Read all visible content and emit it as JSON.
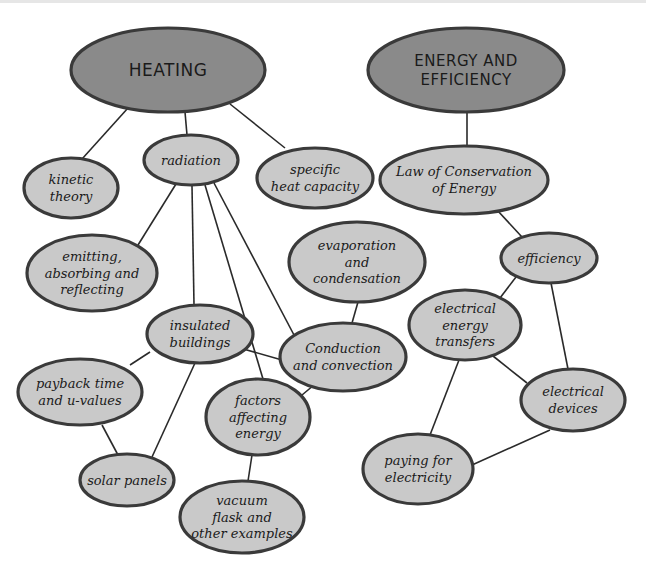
{
  "colors": {
    "root_fill": "#8a8a8a",
    "node_fill": "#c9c9c9",
    "outline": "#3a3a3a",
    "edge": "#2a2a2a",
    "background": "#ffffff"
  },
  "nodes": [
    {
      "id": "heating",
      "kind": "root",
      "lines": [
        "HEATING"
      ]
    },
    {
      "id": "energy",
      "kind": "root",
      "lines": [
        "ENERGY AND",
        "EFFICIENCY"
      ]
    },
    {
      "id": "kinetic",
      "kind": "node",
      "lines": [
        "kinetic",
        "theory"
      ]
    },
    {
      "id": "radiation",
      "kind": "node",
      "lines": [
        "radiation"
      ]
    },
    {
      "id": "specific",
      "kind": "node",
      "lines": [
        "specific",
        "heat capacity"
      ]
    },
    {
      "id": "emitting",
      "kind": "node",
      "lines": [
        "emitting,",
        "absorbing and",
        "reflecting"
      ]
    },
    {
      "id": "evaporation",
      "kind": "node",
      "lines": [
        "evaporation",
        "and",
        "condensation"
      ]
    },
    {
      "id": "insulated",
      "kind": "node",
      "lines": [
        "insulated",
        "buildings"
      ]
    },
    {
      "id": "conduction",
      "kind": "node",
      "lines": [
        "Conduction",
        "and convection"
      ]
    },
    {
      "id": "payback",
      "kind": "node",
      "lines": [
        "payback time",
        "and u-values"
      ]
    },
    {
      "id": "factors",
      "kind": "node",
      "lines": [
        "factors",
        "affecting",
        "energy"
      ]
    },
    {
      "id": "solar",
      "kind": "node",
      "lines": [
        "solar panels"
      ]
    },
    {
      "id": "vacuum",
      "kind": "node",
      "lines": [
        "vacuum",
        "flask and",
        "other examples"
      ]
    },
    {
      "id": "law",
      "kind": "node",
      "lines": [
        "Law of Conservation",
        "of Energy"
      ]
    },
    {
      "id": "efficiency",
      "kind": "node",
      "lines": [
        "efficiency"
      ]
    },
    {
      "id": "transfers",
      "kind": "node",
      "lines": [
        "electrical",
        "energy",
        "transfers"
      ]
    },
    {
      "id": "devices",
      "kind": "node",
      "lines": [
        "electrical",
        "devices"
      ]
    },
    {
      "id": "paying",
      "kind": "node",
      "lines": [
        "paying for",
        "electricity"
      ]
    }
  ],
  "edges": [
    [
      "heating",
      "kinetic"
    ],
    [
      "heating",
      "radiation"
    ],
    [
      "heating",
      "specific"
    ],
    [
      "radiation",
      "emitting"
    ],
    [
      "radiation",
      "insulated"
    ],
    [
      "radiation",
      "factors"
    ],
    [
      "radiation",
      "conduction"
    ],
    [
      "radiation",
      "conduction_b"
    ],
    [
      "evaporation",
      "conduction"
    ],
    [
      "insulated",
      "conduction"
    ],
    [
      "insulated",
      "payback"
    ],
    [
      "insulated",
      "solar"
    ],
    [
      "payback",
      "solar"
    ],
    [
      "conduction",
      "factors"
    ],
    [
      "factors",
      "vacuum"
    ],
    [
      "energy",
      "law"
    ],
    [
      "law",
      "efficiency"
    ],
    [
      "efficiency",
      "transfers"
    ],
    [
      "efficiency",
      "devices"
    ],
    [
      "transfers",
      "devices"
    ],
    [
      "transfers",
      "paying"
    ],
    [
      "devices",
      "paying"
    ]
  ]
}
